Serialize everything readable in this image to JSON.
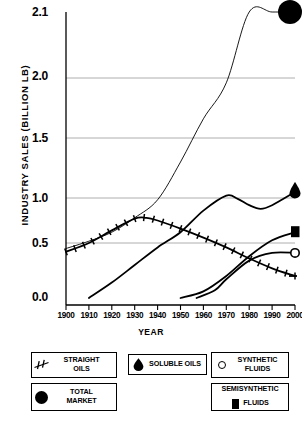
{
  "chart_data": {
    "type": "line",
    "title": "",
    "xlabel": "YEAR",
    "ylabel": "INDUSTRY SALES  (BILLION LB)",
    "xlim": [
      1900,
      2000
    ],
    "ylim": [
      0.0,
      2.1
    ],
    "xticks": [
      1900,
      1910,
      1920,
      1930,
      1940,
      1950,
      1960,
      1970,
      1980,
      1990,
      2000
    ],
    "yticks": [
      0.0,
      0.5,
      1.0,
      1.5,
      2.0,
      2.1
    ],
    "ytick_labels": [
      "0.0",
      "0.5",
      "1.0",
      "1.5",
      "2.0",
      "2.1"
    ],
    "grid": "horizontal",
    "legend_position": "below-plot",
    "series": [
      {
        "name": "TOTAL MARKET",
        "marker": "filled-circle",
        "endpoint_marker_year": 2000,
        "endpoint_marker_value": 2.22,
        "x": [
          1900,
          1910,
          1920,
          1930,
          1940,
          1950,
          1960,
          1970,
          1980,
          1990,
          2000
        ],
        "values": [
          0.45,
          0.52,
          0.62,
          0.78,
          0.98,
          1.3,
          1.66,
          1.96,
          2.14,
          2.21,
          2.22
        ]
      },
      {
        "name": "STRAIGHT OILS",
        "marker": "hatched-line",
        "endpoint_marker_year": 2000,
        "endpoint_marker_value": 0.2,
        "x": [
          1900,
          1910,
          1920,
          1930,
          1935,
          1940,
          1950,
          1960,
          1970,
          1980,
          1990,
          2000
        ],
        "values": [
          0.42,
          0.5,
          0.64,
          0.77,
          0.78,
          0.75,
          0.66,
          0.56,
          0.46,
          0.36,
          0.27,
          0.2
        ]
      },
      {
        "name": "SOLUBLE OILS",
        "marker": "teardrop",
        "endpoint_marker_year": 2000,
        "endpoint_marker_value": 1.05,
        "x": [
          1910,
          1920,
          1930,
          1940,
          1950,
          1960,
          1970,
          1975,
          1980,
          1985,
          1990,
          2000
        ],
        "values": [
          0.0,
          0.14,
          0.3,
          0.46,
          0.62,
          0.86,
          1.02,
          0.99,
          0.92,
          0.88,
          0.92,
          1.05
        ]
      },
      {
        "name": "SEMISYNTHETIC FLUIDS",
        "marker": "filled-square",
        "endpoint_marker_year": 2000,
        "endpoint_marker_value": 0.62,
        "x": [
          1950,
          1960,
          1970,
          1980,
          1990,
          2000
        ],
        "values": [
          0.0,
          0.06,
          0.2,
          0.38,
          0.53,
          0.62
        ]
      },
      {
        "name": "SYNTHETIC FLUIDS",
        "marker": "open-circle",
        "endpoint_marker_year": 2000,
        "endpoint_marker_value": 0.41,
        "x": [
          1957,
          1965,
          1970,
          1980,
          1990,
          2000
        ],
        "values": [
          0.0,
          0.07,
          0.17,
          0.34,
          0.41,
          0.41
        ]
      }
    ]
  },
  "axis": {
    "y_title": "INDUSTRY SALES  (BILLION LB)",
    "x_title": "YEAR",
    "y_tick_labels": [
      "2.1",
      "2.0",
      "1.5",
      "1.0",
      "0.5",
      "0.0"
    ],
    "x_tick_labels": [
      "1900",
      "1910",
      "1920",
      "1930",
      "1940",
      "1950",
      "1960",
      "1970",
      "1980",
      "1990",
      "2000"
    ]
  },
  "legend": {
    "items": [
      {
        "icon": "hatched-line-icon",
        "line1": "STRAIGHT",
        "line2": "OILS"
      },
      {
        "icon": "teardrop-icon",
        "line1": "SOLUBLE OILS",
        "line2": ""
      },
      {
        "icon": "open-circle-icon",
        "line1": "SYNTHETIC",
        "line2": "FLUIDS"
      },
      {
        "icon": "filled-circle-icon",
        "line1": "TOTAL",
        "line2": "MARKET"
      },
      {
        "icon": "filled-square-icon",
        "line1": "SEMISYNTHETIC",
        "line2": "FLUIDS"
      }
    ]
  },
  "colors": {
    "ink": "#000000",
    "grid": "#9a9a9a",
    "background": "#ffffff"
  }
}
